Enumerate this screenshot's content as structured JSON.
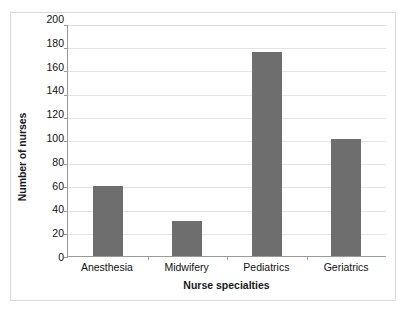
{
  "chart_data": {
    "type": "bar",
    "title": "",
    "subtitle": "",
    "xlabel": "Nurse specialties",
    "ylabel": "Number of nurses",
    "categories": [
      "Anesthesia",
      "Midwifery",
      "Pediatrics",
      "Geriatrics"
    ],
    "values": [
      60,
      30,
      176,
      101
    ],
    "series": [
      {
        "name": "Number of nurses",
        "values": [
          60,
          30,
          176,
          101
        ]
      }
    ],
    "ylim": [
      0,
      200
    ],
    "ytick_step": 20,
    "ytick_labels": [
      "200",
      "180",
      "160",
      "140",
      "120",
      "100",
      "80",
      "60",
      "40",
      "20",
      "0"
    ],
    "ytick_values": [
      200,
      180,
      160,
      140,
      120,
      100,
      80,
      60,
      40,
      20,
      0
    ],
    "grid": "horizontal",
    "legend": "none",
    "annotations": [],
    "colors": {
      "bar_fill": "#6e6e6e",
      "gridline": "#e4e4e4",
      "axis_line": "#9a9a9a",
      "frame_border": "#d9d9d9",
      "background": "#ffffff",
      "tick_text": "#111111",
      "axis_title_text": "#1a1a1a"
    }
  }
}
